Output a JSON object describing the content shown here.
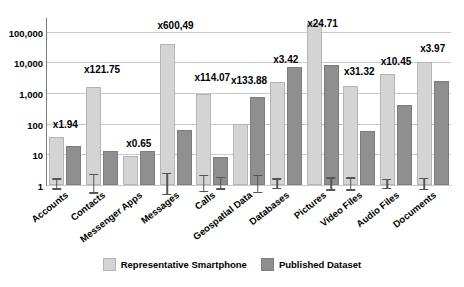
{
  "chart_data": {
    "type": "bar",
    "title": "",
    "subtitle": "",
    "xlabel": "",
    "ylabel": "",
    "log_scale": true,
    "ylim": [
      1,
      300000
    ],
    "yticks": [
      1,
      10,
      100,
      1000,
      10000,
      100000
    ],
    "ytick_labels": [
      "1",
      "10",
      "100",
      "1,000",
      "10,000",
      "100,000"
    ],
    "grid": true,
    "legend_position": "bottom",
    "categories": [
      "Accounts",
      "Contacts",
      "Messenger Apps",
      "Messages",
      "Calls",
      "Geospatial Data",
      "Databases",
      "Pictures",
      "Video Files",
      "Audio Files",
      "Documents"
    ],
    "series": [
      {
        "name": "Representative Smartphone",
        "color": "#d4d4d4",
        "values": [
          31,
          1340,
          7.4,
          33000,
          800,
          82,
          2000,
          170000,
          1500,
          3600,
          8500
        ]
      },
      {
        "name": "Published Dataset",
        "color": "#8f8f8f",
        "values": [
          16,
          11,
          11.4,
          55,
          7,
          620,
          5850,
          6900,
          48,
          345,
          2140
        ]
      }
    ],
    "annotations": [
      "x1.94",
      "x121.75",
      "x0.65",
      "x600,49",
      "x114.07",
      "x133.88",
      "x3.42",
      "x24.71",
      "x31.32",
      "x10.45",
      "x3.97"
    ],
    "error_bars": [
      {
        "category": "Accounts",
        "series": "Representative Smartphone",
        "low": 20,
        "high": 47
      },
      {
        "category": "Contacts",
        "series": "Representative Smartphone",
        "low": 650,
        "high": 2900
      },
      {
        "category": "Messages",
        "series": "Representative Smartphone",
        "low": 14000,
        "high": 78000
      },
      {
        "category": "Calls",
        "series": "Representative Smartphone",
        "low": 430,
        "high": 1600
      },
      {
        "category": "Calls",
        "series": "Published Dataset",
        "low": 4.6,
        "high": 12
      },
      {
        "category": "Geospatial Data",
        "series": "Published Dataset",
        "low": 310,
        "high": 1250
      },
      {
        "category": "Databases",
        "series": "Representative Smartphone",
        "low": 1350,
        "high": 3100
      },
      {
        "category": "Pictures",
        "series": "Published Dataset",
        "low": 4200,
        "high": 11500
      },
      {
        "category": "Video Files",
        "series": "Representative Smartphone",
        "low": 900,
        "high": 2500
      },
      {
        "category": "Audio Files",
        "series": "Representative Smartphone",
        "low": 2400,
        "high": 5400
      },
      {
        "category": "Documents",
        "series": "Representative Smartphone",
        "low": 5400,
        "high": 13500
      }
    ],
    "legend": [
      {
        "label": "Representative Smartphone",
        "color": "#d4d4d4"
      },
      {
        "label": "Published Dataset",
        "color": "#8f8f8f"
      }
    ]
  }
}
